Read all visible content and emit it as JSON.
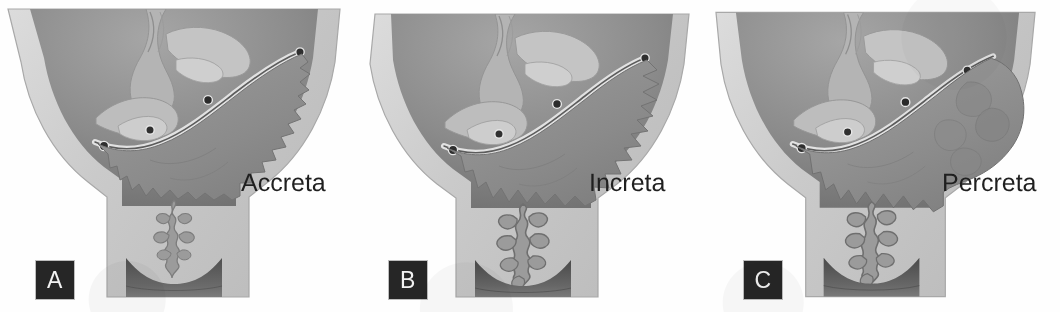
{
  "figure": {
    "panel_count": 3
  },
  "panels": [
    {
      "id": "A",
      "badge": "A",
      "label": "Accreta",
      "description": "Placental villi attach to the myometrium without invading it",
      "invasion_depth": "superficial"
    },
    {
      "id": "B",
      "badge": "B",
      "label": "Increta",
      "description": "Placental villi invade into the myometrium",
      "invasion_depth": "intramyometrial"
    },
    {
      "id": "C",
      "badge": "C",
      "label": "Percreta",
      "description": "Placental villi penetrate through the myometrium and serosa",
      "invasion_depth": "through-serosa"
    }
  ],
  "colors": {
    "page_background": "#fefefe",
    "badge_background": "#262626",
    "badge_text": "#f2f2f2",
    "label_text": "#1f1f1f",
    "uterine_wall": "#c9c9c9",
    "uterine_wall_light": "#d7d7d7",
    "cavity_dark": "#8e8e8e",
    "cavity_darker": "#6f6f6f",
    "placenta": "#8a8a8a",
    "membrane_line": "#5c5c5c",
    "vessel": "#2e2e2e",
    "cervix_canal": "#999999",
    "vagina_dark": "#5e5e5e"
  }
}
